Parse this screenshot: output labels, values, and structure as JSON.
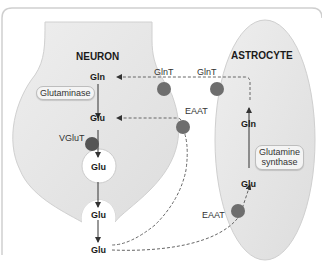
{
  "figure": {
    "cells": {
      "neuron": {
        "title": "NEURON"
      },
      "astrocyte": {
        "title": "ASTROCYTE"
      }
    },
    "neuron_molecules": {
      "gln": "Gln",
      "glu_cytosol": "Glu",
      "glu_vesicle": "Glu",
      "glu_release_vesicle": "Glu",
      "glu_synaptic": "Glu"
    },
    "astrocyte_molecules": {
      "gln": "Gln",
      "glu": "Glu"
    },
    "enzymes": {
      "glutaminase": "Glutaminase",
      "glutamine_synthase_line1": "Glutamine",
      "glutamine_synthase_line2": "synthase"
    },
    "transporters": {
      "glnt_neuron": "GlnT",
      "glnt_astrocyte": "GlnT",
      "eaat_neuron": "EAAT",
      "eaat_astrocyte": "EAAT",
      "vglut": "VGluT"
    },
    "colors": {
      "cell_fill": "#e6e6e6",
      "transporter": "#6e6e6e",
      "frame": "#cfcfcf",
      "arrow": "#333333",
      "dashed": "#666666"
    }
  }
}
